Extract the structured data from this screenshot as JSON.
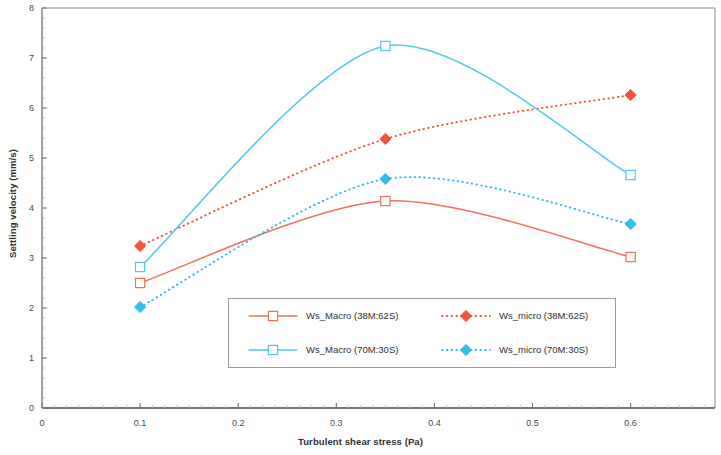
{
  "chart_data": {
    "type": "line",
    "title": "",
    "xlabel": "Turbulent shear stress (Pa)",
    "ylabel": "Settling velocity (mm/s)",
    "x": [
      0.1,
      0.35,
      0.6
    ],
    "xlim": [
      0,
      0.686
    ],
    "ylim": [
      0,
      8
    ],
    "xticks": [
      0,
      0.1,
      0.2,
      0.3,
      0.4,
      0.5,
      0.6
    ],
    "xtick_labels": [
      "0",
      "0.1",
      "0.2",
      "0.3",
      "0.4",
      "0.5",
      "0.6"
    ],
    "yticks": [
      0,
      1,
      2,
      3,
      4,
      5,
      6,
      7,
      8
    ],
    "ytick_labels": [
      "0",
      "1",
      "2",
      "3",
      "4",
      "5",
      "6",
      "7",
      "8"
    ],
    "x_minor_tick_step": 0.0125,
    "y_minor_tick_step": 0.2,
    "grid": false,
    "legend_position": "inside-lower-center",
    "series": [
      {
        "name": "Ws_Macro (38M:62S)",
        "values": [
          2.5,
          4.14,
          3.02
        ],
        "color": "#F0705C",
        "line_style": "solid",
        "marker": "square-open",
        "smooth": true
      },
      {
        "name": "Ws_micro (38M:62S)",
        "values": [
          3.24,
          5.38,
          6.26
        ],
        "color": "#F4553A",
        "line_style": "dotted",
        "marker": "diamond-filled",
        "smooth": true
      },
      {
        "name": "Ws_Macro (70M:30S)",
        "values": [
          2.82,
          7.24,
          4.66
        ],
        "color": "#52C8E8",
        "line_style": "solid",
        "marker": "square-open",
        "smooth": true
      },
      {
        "name": "Ws_micro (70M:30S)",
        "values": [
          2.02,
          4.58,
          3.68
        ],
        "color": "#30BEEA",
        "line_style": "dotted",
        "marker": "diamond-filled",
        "smooth": true
      }
    ]
  },
  "axes": {
    "xlabel": "Turbulent shear stress (Pa)",
    "ylabel": "Settling velocity (mm/s)"
  },
  "legend": {
    "entries": [
      {
        "label": "Ws_Macro (38M:62S)"
      },
      {
        "label": "Ws_micro (38M:62S)"
      },
      {
        "label": "Ws_Macro (70M:30S)"
      },
      {
        "label": "Ws_micro (70M:30S)"
      }
    ]
  }
}
